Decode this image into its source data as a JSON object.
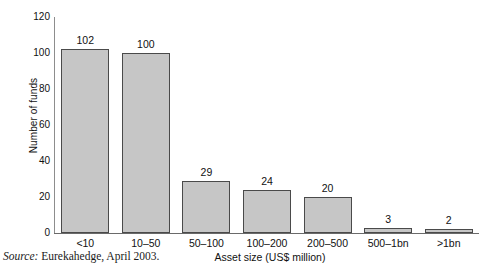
{
  "chart_data": {
    "type": "bar",
    "title": "",
    "subtitle": "",
    "xlabel": "Asset size (US$ million)",
    "ylabel": "Number of funds",
    "categories": [
      "<10",
      "10–50",
      "50–100",
      "100–200",
      "200–500",
      "500–1bn",
      ">1bn"
    ],
    "values": [
      102,
      100,
      29,
      24,
      20,
      3,
      2
    ],
    "data_labels": [
      "102",
      "100",
      "29",
      "24",
      "20",
      "3",
      "2"
    ],
    "ylim": [
      0,
      120
    ],
    "yticks": [
      0,
      20,
      40,
      60,
      80,
      100,
      120
    ],
    "ytick_labels": [
      "0",
      "20",
      "40",
      "60",
      "80",
      "100",
      "120"
    ],
    "grid": false,
    "legend": null,
    "bar_fill_color": "#c6c6c6",
    "bar_edge_color": "#4a4a4a",
    "axis_color": "#6a6a6a",
    "background_color": "#ffffff"
  },
  "source": {
    "label": "Source:",
    "text": "Eurekahedge, April 2003."
  }
}
